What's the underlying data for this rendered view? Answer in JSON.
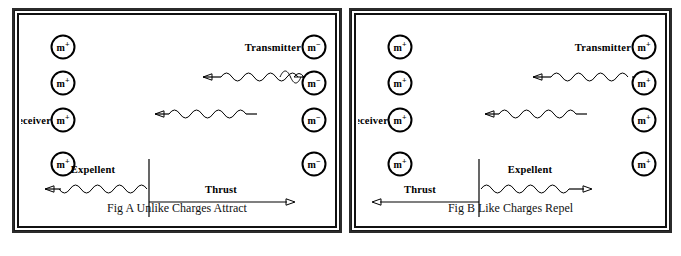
{
  "figure": {
    "title_hidden": "",
    "panels": [
      {
        "id": "fig-a",
        "caption": "Fig A Unlike Charges Attract",
        "labels": {
          "transmitter": "Transmitter",
          "receiver": "Receiver",
          "expellent": "Expellent",
          "thrust": "Thrust"
        },
        "left_column_charges": [
          {
            "symbol": "m",
            "sign": "+"
          },
          {
            "symbol": "m",
            "sign": "+"
          },
          {
            "symbol": "m",
            "sign": "+"
          },
          {
            "symbol": "m",
            "sign": "+"
          }
        ],
        "right_column_charges": [
          {
            "symbol": "m",
            "sign": "−"
          },
          {
            "symbol": "m",
            "sign": "−"
          },
          {
            "symbol": "m",
            "sign": "−"
          },
          {
            "symbol": "m",
            "sign": "−"
          }
        ],
        "thrust_direction": "right",
        "expellent_direction": "left",
        "wave_direction": "leftward"
      },
      {
        "id": "fig-b",
        "caption": "Fig B Like Charges Repel",
        "labels": {
          "transmitter": "Transmitter",
          "receiver": "Receiver",
          "expellent": "Expellent",
          "thrust": "Thrust"
        },
        "left_column_charges": [
          {
            "symbol": "m",
            "sign": "+"
          },
          {
            "symbol": "m",
            "sign": "+"
          },
          {
            "symbol": "m",
            "sign": "+"
          },
          {
            "symbol": "m",
            "sign": "+"
          }
        ],
        "right_column_charges": [
          {
            "symbol": "m",
            "sign": "+"
          },
          {
            "symbol": "m",
            "sign": "+"
          },
          {
            "symbol": "m",
            "sign": "+"
          },
          {
            "symbol": "m",
            "sign": "+"
          }
        ],
        "thrust_direction": "left",
        "expellent_direction": "right",
        "wave_direction": "leftward"
      }
    ],
    "colors": {
      "ink": "#000000",
      "frame": "#111111",
      "background": "#ffffff"
    }
  }
}
